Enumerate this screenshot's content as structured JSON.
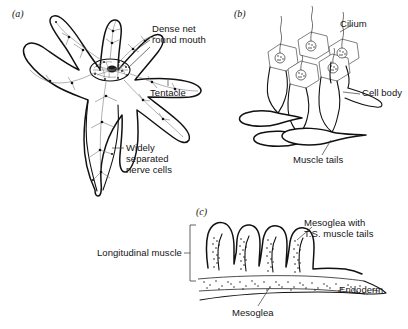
{
  "figure": {
    "panels": [
      {
        "id": "a",
        "id_label": "(a)",
        "subject": "sea-anemone-nerve-net",
        "labels": [
          {
            "name": "dense-net-round-mouth",
            "lines": [
              "Dense net",
              "round mouth"
            ]
          },
          {
            "name": "tentacle",
            "lines": [
              "Tentacle"
            ]
          },
          {
            "name": "widely-separated-nerve-cells",
            "lines": [
              "Widely",
              "separated",
              "nerve cells"
            ]
          }
        ]
      },
      {
        "id": "b",
        "id_label": "(b)",
        "subject": "ciliated-epithelial-muscle-cells",
        "labels": [
          {
            "name": "cilium",
            "lines": [
              "Cilium"
            ]
          },
          {
            "name": "cell-body",
            "lines": [
              "Cell body"
            ]
          },
          {
            "name": "muscle-tails",
            "lines": [
              "Muscle tails"
            ]
          }
        ]
      },
      {
        "id": "c",
        "id_label": "(c)",
        "subject": "longitudinal-muscle-section",
        "labels": [
          {
            "name": "longitudinal-muscle",
            "lines": [
              "Longitudinal muscle"
            ]
          },
          {
            "name": "mesoglea-with-ts-muscle-tails",
            "lines": [
              "Mesoglea with",
              "T.S. muscle tails"
            ]
          },
          {
            "name": "endoderm",
            "lines": [
              "Endoderm"
            ]
          },
          {
            "name": "mesoglea",
            "lines": [
              "Mesoglea"
            ]
          }
        ]
      }
    ]
  },
  "panel_a": {
    "id_label": "(a)",
    "dense_net_line1": "Dense net",
    "dense_net_line2": "round mouth",
    "tentacle": "Tentacle",
    "nerve_line1": "Widely",
    "nerve_line2": "separated",
    "nerve_line3": "nerve cells"
  },
  "panel_b": {
    "id_label": "(b)",
    "cilium": "Cilium",
    "cell_body": "Cell body",
    "muscle_tails": "Muscle tails"
  },
  "panel_c": {
    "id_label": "(c)",
    "longitudinal_muscle": "Longitudinal muscle",
    "mesoglea_ts_line1": "Mesoglea with",
    "mesoglea_ts_line2": "T.S. muscle tails",
    "endoderm": "Endoderm",
    "mesoglea": "Mesoglea"
  },
  "colors": {
    "background": "#ffffff",
    "ink": "#111111",
    "label_text": "#141414",
    "nerve_net": "#6e6e6e",
    "leader_line": "#3a3a3a",
    "cell_outline": "#555555"
  }
}
